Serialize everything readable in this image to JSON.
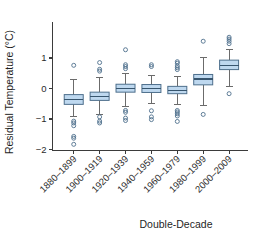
{
  "chart_data": {
    "type": "box",
    "title": "",
    "xlabel": "Double-Decade",
    "ylabel": "Residual Temperature (°C)",
    "ylim": [
      -2.05,
      1.75
    ],
    "yticks": [
      1,
      0,
      -1,
      -2
    ],
    "ytick_labels": [
      "1",
      "0",
      "−1",
      "−2"
    ],
    "grid": false,
    "legend": null,
    "categories": [
      "1880–1899",
      "1900–1919",
      "1920–1939",
      "1940–1959",
      "1960–1979",
      "1980–1999",
      "2000–2009"
    ],
    "boxes": [
      {
        "category": "1880–1899",
        "whisker_low": -0.93,
        "q1": -0.52,
        "median": -0.35,
        "q3": -0.2,
        "whisker_high": 0.29,
        "outliers": [
          0.76,
          -1.07,
          -1.13,
          -1.22,
          -1.57,
          -1.63,
          -1.83
        ]
      },
      {
        "category": "1900–1919",
        "whisker_low": -0.85,
        "q1": -0.39,
        "median": -0.26,
        "q3": -0.12,
        "whisker_high": 0.35,
        "outliers": [
          0.85,
          0.63,
          0.57,
          -0.93,
          -1.07,
          -1.13
        ]
      },
      {
        "category": "1920–1939",
        "whisker_low": -0.58,
        "q1": -0.12,
        "median": 0.01,
        "q3": 0.14,
        "whisker_high": 0.5,
        "outliers": [
          1.27,
          0.78,
          0.72,
          0.65,
          -0.72,
          -0.78,
          -0.97,
          -1.05
        ]
      },
      {
        "category": "1940–1959",
        "whisker_low": -0.48,
        "q1": -0.13,
        "median": 0.0,
        "q3": 0.13,
        "whisker_high": 0.43,
        "outliers": [
          0.78,
          0.72,
          -0.73,
          -0.93,
          -1.02
        ]
      },
      {
        "category": "1960–1979",
        "whisker_low": -0.52,
        "q1": -0.17,
        "median": -0.06,
        "q3": 0.07,
        "whisker_high": 0.38,
        "outliers": [
          0.88,
          0.83,
          0.74,
          0.68,
          0.62,
          -0.72,
          -0.77,
          -0.83,
          -0.9,
          -1.08
        ]
      },
      {
        "category": "1980–1999",
        "whisker_low": -0.57,
        "q1": 0.12,
        "median": 0.31,
        "q3": 0.46,
        "whisker_high": 1.02,
        "outliers": [
          1.55,
          -0.85
        ]
      },
      {
        "category": "2000–2009",
        "whisker_low": 0.05,
        "q1": 0.62,
        "median": 0.75,
        "q3": 0.93,
        "whisker_high": 1.27,
        "outliers": [
          1.68,
          1.62,
          1.55,
          1.47,
          -0.17
        ]
      }
    ],
    "colors": {
      "box_fill": "#bed8ef",
      "box_edge": "#4e6f8c",
      "median": "#37556e",
      "whisker": "#6b6b6b",
      "outlier_edge": "#4e6f8c",
      "axis": "#3b3b3b",
      "text": "#1f1f1f",
      "background": "#ffffff"
    }
  }
}
